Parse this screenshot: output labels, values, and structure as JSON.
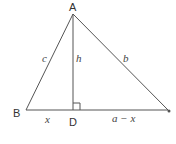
{
  "diagram": {
    "type": "triangle-with-altitude",
    "vertices": {
      "A": {
        "label": "A",
        "x": 73,
        "y": 14
      },
      "B": {
        "label": "B",
        "x": 26,
        "y": 110
      },
      "C": {
        "label": "",
        "x": 168,
        "y": 110
      },
      "D": {
        "label": "D",
        "x": 73,
        "y": 110
      }
    },
    "side_labels": {
      "c": "c",
      "b": "b",
      "h": "h",
      "x": "x",
      "a_minus_x": "a − x"
    },
    "right_angle_marker": "D",
    "line_color": "#555555"
  }
}
